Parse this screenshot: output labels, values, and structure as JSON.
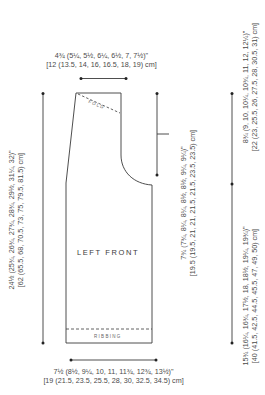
{
  "diagram": {
    "piece_name": "LEFT FRONT",
    "annotations": {
      "fold": "FOLD",
      "ribbing": "RIBBING"
    },
    "measurements": {
      "shoulder_width": {
        "imperial": "4¾ (5¼, 5½, 6¼, 6½, 7, 7½)\"",
        "metric": "[12 (13.5, 14, 16, 16.5, 18, 19) cm]"
      },
      "total_length": {
        "imperial": "24½ (25¾, 26¾, 27¾, 28¾, 29½, 31¼, 32)\"",
        "metric": "[62 (65.5, 68, 70.5, 73, 75, 79.5, 81.5) cm]"
      },
      "armhole_depth": {
        "imperial": "7¾ (7¾, 8¼, 8¼, 8½, 8½, 9¼, 9¼)\"",
        "metric": "[19.5 (19.5, 21, 21, 21.5, 21.5, 23.5, 23.5) cm]"
      },
      "upper_length": {
        "imperial": "8¾ (9, 10, 10¼, 10¾, 11, 12, 12¼)\"",
        "metric": "[22 (23, 25.5, 26, 27.5, 28, 30.5, 31) cm]"
      },
      "lower_length": {
        "imperial": "15¾ (16¼, 16¾, 17½, 18, 18½, 19¼, 19¾)\"",
        "metric": "[40 (41.5, 42.5, 44.5, 45.5, 47, 49, 50) cm]"
      },
      "bottom_width": {
        "imperial": "7½ (8½, 9¼, 10, 11, 11¾, 12¾, 13½)\"",
        "metric": "[19 (21.5, 23.5, 25.5, 28, 30, 32.5, 34.5) cm]"
      }
    },
    "colors": {
      "line": "#3a3a3a",
      "text": "#4a4a4a",
      "background": "#ffffff"
    }
  }
}
